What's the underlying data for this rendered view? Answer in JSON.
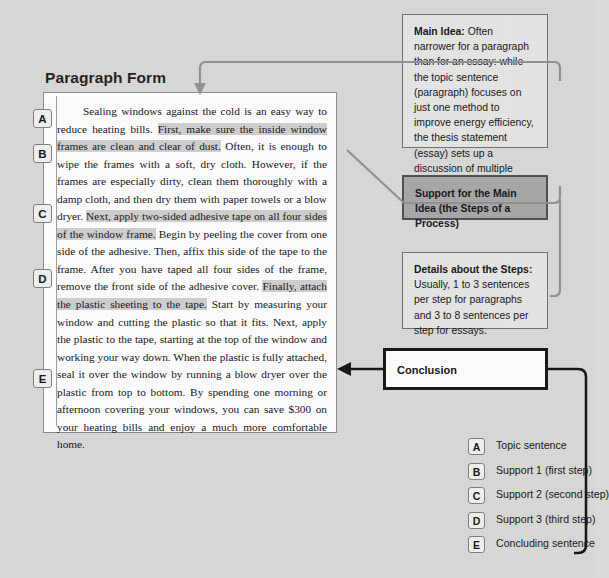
{
  "page": {
    "title": "Paragraph Form",
    "paragraph_segments": [
      {
        "text": "Sealing windows against the cold is an easy way to reduce heating bills. ",
        "highlight": false
      },
      {
        "text": "First, make sure the inside window frames are clean and clear of dust.",
        "highlight": true
      },
      {
        "text": " Often, it is enough to wipe the frames with a soft, dry cloth. However, if the frames are especially dirty, clean them thoroughly with a damp cloth, and then dry them with paper towels or a blow dryer. ",
        "highlight": false
      },
      {
        "text": "Next, apply two-sided adhesive tape on all four sides of the window frame.",
        "highlight": true
      },
      {
        "text": " Begin by peeling the cover from one side of the adhesive. Then, affix this side of the tape to the frame. After you have taped all four sides of the frame, remove the front side of the adhesive cover. ",
        "highlight": false
      },
      {
        "text": "Finally, attach the plastic sheeting to the tape.",
        "highlight": true
      },
      {
        "text": " Start by measuring your window and cutting the plastic so that it fits. Next, apply the plastic to the tape, starting at the top of the window and working your way down. When the plastic is fully attached, seal it over the window by running a blow dryer over the plastic from top to bottom. By spending one morning or afternoon covering your windows, you can save $300 on your heating bills and enjoy a much more comfortable home.",
        "highlight": false
      }
    ]
  },
  "markers": {
    "a": "A",
    "b": "B",
    "c": "C",
    "d": "D",
    "e": "E"
  },
  "callouts": {
    "main_idea": {
      "heading": "Main Idea:",
      "body": " Often narrower for a paragraph than for an essay: while the topic sentence (paragraph) focuses on just one method to improve energy efficiency, the thesis statement (essay) sets up a discussion of multiple methods."
    },
    "support": {
      "text": "Support for the Main Idea (the Steps of a Process)"
    },
    "details": {
      "heading": "Details about the Steps:",
      "body": " Usually, 1 to 3 sentences per step for paragraphs and 3 to 8 sentences per step for essays."
    },
    "conclusion": {
      "text": "Conclusion"
    }
  },
  "legend": {
    "items": [
      {
        "marker": "A",
        "label": "Topic sentence"
      },
      {
        "marker": "B",
        "label": "Support 1 (first step)"
      },
      {
        "marker": "C",
        "label": "Support 2 (second step)"
      },
      {
        "marker": "D",
        "label": "Support 3 (third step)"
      },
      {
        "marker": "E",
        "label": "Concluding sentence"
      }
    ]
  },
  "colors": {
    "background": "#d9d9d7",
    "paper": "#ffffff",
    "highlight": "#cfcfcf",
    "callout_light": "#e6e6e4",
    "callout_gray": "#a6a6a6",
    "connector": "#8f8f8f",
    "conclusion_border": "#121212"
  }
}
